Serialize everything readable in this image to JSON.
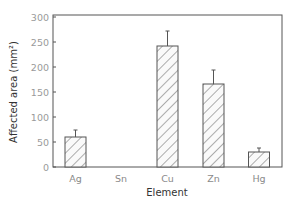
{
  "chart_data": {
    "type": "bar",
    "title": "",
    "xlabel": "Element",
    "ylabel": "Affected area (mm²)",
    "categories": [
      "Ag",
      "Sn",
      "Cu",
      "Zn",
      "Hg"
    ],
    "values": [
      60,
      0,
      242,
      166,
      30
    ],
    "error_upper": [
      74,
      0,
      272,
      194,
      38
    ],
    "ylim": [
      0,
      300
    ],
    "yticks": [
      0,
      50,
      100,
      150,
      200,
      250,
      300
    ],
    "grid": false,
    "legend": null,
    "bar_fill": "diagonal-hatch",
    "colors": {
      "axis": "#555555",
      "bar_edge": "#555555",
      "hatch": "#777777",
      "tick_text": "#9a9a9a"
    }
  }
}
